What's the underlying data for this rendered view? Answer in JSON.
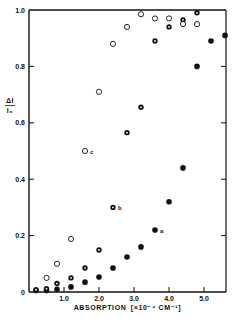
{
  "chart_data": {
    "type": "scatter",
    "title": "",
    "xlabel": "ABSORPTION [×10⁻⁴ CM⁻¹]",
    "ylabel": "ΔI / I₀",
    "xlim": [
      0,
      5.6
    ],
    "ylim": [
      0,
      1.0
    ],
    "x_ticks": [
      1.0,
      2.0,
      3.0,
      4.0,
      5.0
    ],
    "x_tick_labels": [
      "1.0",
      "2.0",
      "3.0",
      "4.0",
      "5.0"
    ],
    "y_ticks": [
      0,
      0.2,
      0.4,
      0.6,
      0.8,
      1.0
    ],
    "y_tick_labels": [
      "0",
      "0.2",
      "0.4",
      "0.6",
      "0.8",
      "1.0"
    ],
    "grid": false,
    "legend": "inline point labels a, b, c",
    "series": [
      {
        "name": "a",
        "marker": "filled-circle",
        "label_at": [
          3.6,
          0.22
        ],
        "x": [
          0.2,
          0.5,
          0.8,
          1.2,
          1.6,
          2.0,
          2.4,
          2.8,
          3.2,
          3.6,
          4.0,
          4.4,
          4.8,
          5.2,
          5.6
        ],
        "values": [
          0.005,
          0.005,
          0.01,
          0.018,
          0.035,
          0.053,
          0.085,
          0.124,
          0.16,
          0.22,
          0.32,
          0.44,
          0.8,
          0.89,
          0.91
        ]
      },
      {
        "name": "b",
        "marker": "dotted-circle",
        "label_at": [
          2.4,
          0.3
        ],
        "x": [
          0.2,
          0.5,
          0.8,
          1.2,
          1.6,
          2.0,
          2.4,
          2.8,
          3.2,
          3.6,
          4.0,
          4.4,
          4.8
        ],
        "values": [
          0.008,
          0.012,
          0.03,
          0.05,
          0.085,
          0.149,
          0.3,
          0.565,
          0.655,
          0.89,
          0.94,
          0.965,
          0.99
        ]
      },
      {
        "name": "c",
        "marker": "open-circle",
        "label_at": [
          1.6,
          0.5
        ],
        "x": [
          0.5,
          0.8,
          1.2,
          1.6,
          2.0,
          2.4,
          2.8,
          3.2,
          3.6,
          4.0,
          4.4,
          4.8
        ],
        "values": [
          0.05,
          0.1,
          0.188,
          0.5,
          0.71,
          0.88,
          0.94,
          0.985,
          0.97,
          0.97,
          0.95,
          0.95
        ]
      }
    ]
  },
  "axis": {
    "y_label_top": "ΔI",
    "y_label_bottom": "I₀",
    "x_label_word": "ABSORPTION",
    "x_label_unit": "[×10⁻⁴ CM⁻¹]"
  },
  "colors": {
    "ink": "#111111",
    "background": "#ffffff"
  }
}
